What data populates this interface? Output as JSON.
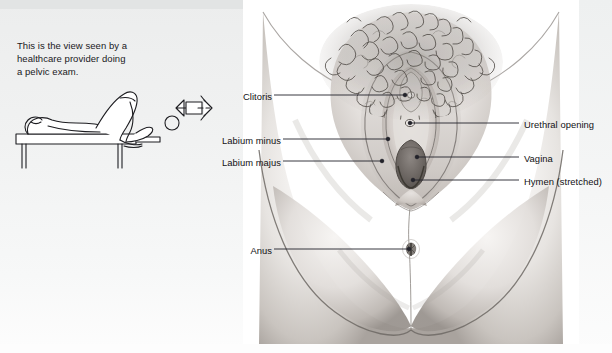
{
  "figure": {
    "type": "medical-illustration"
  },
  "caption": {
    "text": "This is the view seen by a healthcare provider doing a pelvic exam.",
    "line1": "This is the view seen by a",
    "line2": "healthcare provider doing",
    "line3": "a pelvic exam."
  },
  "inset": {
    "name": "patient-lithotomy-position-line-drawing",
    "elements": [
      "reclining-patient",
      "exam-table",
      "view-direction-arrow",
      "eye-symbol"
    ]
  },
  "labels": {
    "left": [
      {
        "id": "clitoris",
        "text": "Clitoris",
        "x": 236,
        "y": 98,
        "line_to_x": 404,
        "line_to_y": 95
      },
      {
        "id": "labium-minus",
        "text": "Labium minus",
        "x": 270,
        "y": 141,
        "line_to_x": 387,
        "line_to_y": 139
      },
      {
        "id": "labium-majus",
        "text": "Labium majus",
        "x": 270,
        "y": 163,
        "line_to_x": 381,
        "line_to_y": 161
      }
    ],
    "right": [
      {
        "id": "urethral-opening",
        "text": "Urethral opening",
        "x": 523,
        "y": 126,
        "line_to_x": 407,
        "line_to_y": 123
      },
      {
        "id": "vagina",
        "text": "Vagina",
        "x": 523,
        "y": 158,
        "line_to_x": 414,
        "line_to_y": 157
      },
      {
        "id": "hymen-stretched",
        "text": "Hymen (stretched)",
        "x": 523,
        "y": 180,
        "line_to_x": 410,
        "line_to_y": 178
      }
    ],
    "bottom": [
      {
        "id": "anus",
        "text": "Anus",
        "x": 247,
        "y": 251,
        "line_to_x": 406,
        "line_to_y": 249
      }
    ]
  },
  "colors": {
    "page_background": "#f2f3f3",
    "panel_background": "#ffffff",
    "label_text": "#111114",
    "leader_line": "#23232a",
    "line_art": "#2a2a30",
    "skin_light": "#f2f0ee",
    "skin_mid": "#d8d4d1",
    "skin_shadow": "#9c9792",
    "vagina_dark": "#6f6a67"
  }
}
